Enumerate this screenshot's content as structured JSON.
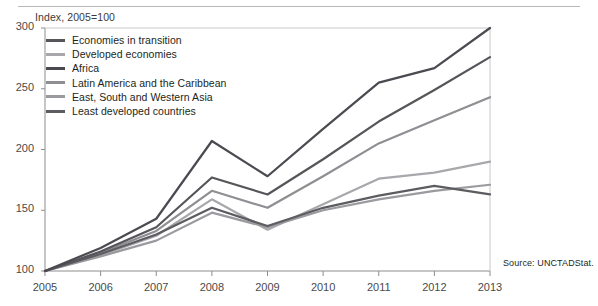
{
  "figure": {
    "axis_note": "Index, 2005=100",
    "source": "Source:  UNCTADStat."
  },
  "chart_data": {
    "type": "line",
    "title": "",
    "subtitle": "Index, 2005=100",
    "xlabel": "",
    "ylabel": "",
    "x": [
      2005,
      2006,
      2007,
      2008,
      2009,
      2010,
      2011,
      2012,
      2013
    ],
    "xtick_labels": [
      "2005",
      "2006",
      "2007",
      "2008",
      "2009",
      "2010",
      "2011",
      "2012",
      "2013"
    ],
    "ytick_labels": [
      "100",
      "150",
      "200",
      "250",
      "300"
    ],
    "yticks": [
      100,
      150,
      200,
      250,
      300
    ],
    "ylim": [
      100,
      300
    ],
    "xlim": [
      2005,
      2013
    ],
    "grid": false,
    "legend_position": "upper-left",
    "series": [
      {
        "name": "Economies in transition",
        "color": "#55555a",
        "width": 2.2,
        "values": [
          100,
          116,
          136,
          177,
          163,
          192,
          223,
          249,
          276
        ]
      },
      {
        "name": "Developed economies",
        "color": "#a8a8ac",
        "width": 2.2,
        "values": [
          100,
          113,
          129,
          159,
          134,
          155,
          176,
          181,
          190
        ]
      },
      {
        "name": "Africa",
        "color": "#4a4a50",
        "width": 2.2,
        "values": [
          100,
          119,
          143,
          207,
          178,
          217,
          255,
          267,
          300
        ]
      },
      {
        "name": "Latin America and the Caribbean",
        "color": "#8e8e93",
        "width": 2.2,
        "values": [
          100,
          115,
          133,
          166,
          152,
          178,
          205,
          224,
          243
        ]
      },
      {
        "name": "East, South and Western Asia",
        "color": "#9a9a9f",
        "width": 2.2,
        "values": [
          100,
          112,
          125,
          148,
          136,
          150,
          159,
          166,
          171
        ]
      },
      {
        "name": "Least developed countries",
        "color": "#5c5c61",
        "width": 2.2,
        "values": [
          100,
          114,
          130,
          152,
          137,
          152,
          162,
          170,
          163
        ]
      }
    ]
  },
  "legend": {
    "items": [
      {
        "label": "Economies in transition"
      },
      {
        "label": "Developed economies"
      },
      {
        "label": "Africa"
      },
      {
        "label": "Latin America and the Caribbean"
      },
      {
        "label": "East, South and Western Asia"
      },
      {
        "label": "Least developed countries"
      }
    ]
  }
}
